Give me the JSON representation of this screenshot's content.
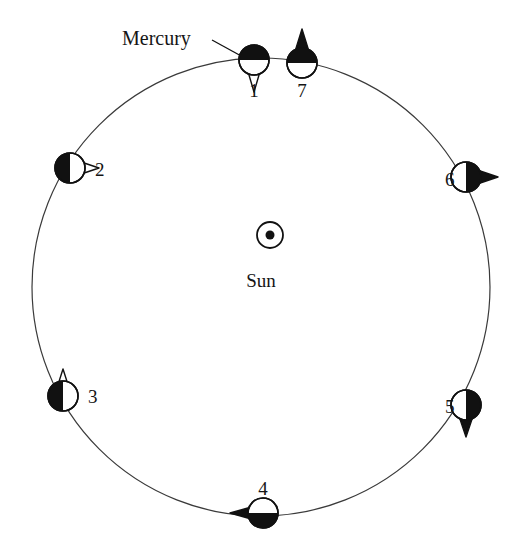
{
  "figure": {
    "background_color": "#ffffff",
    "ink_color": "#111111",
    "orbit_line_color": "#3a3a3a"
  },
  "orbit": {
    "center_x": 261,
    "center_y": 287,
    "radius": 229,
    "stroke_width": 1.2
  },
  "center_body": {
    "name": "sun-symbol",
    "label": "Sun",
    "label_x": 261,
    "label_y": 271,
    "symbol_x": 270,
    "symbol_y": 235,
    "outer_radius": 13,
    "inner_radius": 4.5
  },
  "callout": {
    "label": "Mercury",
    "label_x": 122,
    "label_y": 28,
    "leader_from_x": 212,
    "leader_from_y": 40,
    "leader_to_x": 243,
    "leader_to_y": 57
  },
  "positions": [
    {
      "id": "1",
      "label": "1",
      "cx": 254,
      "cy": 60,
      "radius": 15,
      "dark_half": "top",
      "spike_direction": "down",
      "spike_filled": false,
      "spike_length": 17,
      "spike_half_width": 7,
      "label_x": 254,
      "label_y": 81
    },
    {
      "id": "7",
      "label": "7",
      "cx": 302,
      "cy": 63,
      "radius": 15,
      "dark_half": "top",
      "spike_direction": "up",
      "spike_filled": true,
      "spike_length": 19,
      "spike_half_width": 8,
      "label_x": 302,
      "label_y": 81
    },
    {
      "id": "6",
      "label": "6",
      "cx": 466,
      "cy": 177,
      "radius": 15,
      "dark_half": "right",
      "spike_direction": "right",
      "spike_filled": true,
      "spike_length": 17,
      "spike_half_width": 8,
      "label_x": 445,
      "label_y": 170
    },
    {
      "id": "5",
      "label": "5",
      "cx": 466,
      "cy": 405,
      "radius": 15,
      "dark_half": "right",
      "spike_direction": "down",
      "spike_filled": true,
      "spike_length": 17,
      "spike_half_width": 8,
      "label_x": 445,
      "label_y": 397
    },
    {
      "id": "4",
      "label": "4",
      "cx": 263,
      "cy": 513,
      "radius": 15,
      "dark_half": "bottom",
      "spike_direction": "left",
      "spike_filled": true,
      "spike_length": 18,
      "spike_half_width": 7,
      "label_x": 263,
      "label_y": 479,
      "label_above": true
    },
    {
      "id": "3",
      "label": "3",
      "cx": 63,
      "cy": 396,
      "radius": 15,
      "dark_half": "left",
      "spike_direction": "up",
      "spike_filled": false,
      "spike_length": 12,
      "spike_half_width": 6,
      "label_x": 88,
      "label_y": 387
    },
    {
      "id": "2",
      "label": "2",
      "cx": 70,
      "cy": 168,
      "radius": 15,
      "dark_half": "left",
      "spike_direction": "right",
      "spike_filled": false,
      "spike_length": 14,
      "spike_half_width": 7,
      "label_x": 95,
      "label_y": 160
    }
  ]
}
